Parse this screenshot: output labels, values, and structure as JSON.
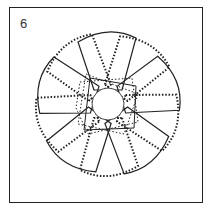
{
  "figure": {
    "number_label": "6",
    "solid_petals": 5,
    "dotted_petals": 5,
    "colors": {
      "stroke": "#222222",
      "background": "#ffffff"
    }
  }
}
